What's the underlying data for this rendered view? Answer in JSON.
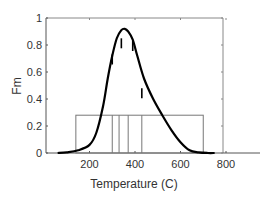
{
  "chart_data": {
    "type": "line",
    "title": "",
    "xlabel": "Temperature (C)",
    "ylabel": "Fm",
    "xlim": [
      0,
      940
    ],
    "ylim": [
      0,
      1
    ],
    "xticks": [
      200,
      400,
      600,
      800
    ],
    "yticks": [
      0,
      0.2,
      0.4,
      0.6,
      0.8,
      1
    ],
    "ytick_labels": [
      "0",
      "0.2",
      "0.4",
      "0.6",
      "0.8",
      "1"
    ],
    "xtick_labels": [
      "200",
      "400",
      "600",
      "800"
    ],
    "grid": false,
    "legend": null,
    "series": [
      {
        "name": "Fm curve",
        "x": [
          60,
          100,
          150,
          200,
          230,
          260,
          280,
          300,
          320,
          340,
          355,
          370,
          390,
          410,
          440,
          480,
          520,
          560,
          600,
          640,
          680,
          720,
          750
        ],
        "y": [
          0.0,
          0.005,
          0.02,
          0.06,
          0.15,
          0.35,
          0.55,
          0.72,
          0.85,
          0.91,
          0.92,
          0.9,
          0.84,
          0.72,
          0.55,
          0.4,
          0.28,
          0.17,
          0.08,
          0.02,
          0.005,
          0.0,
          0.0
        ]
      }
    ],
    "annotations": {
      "outer_box": {
        "x_start": 140,
        "x_end": 700,
        "height": 0.28
      },
      "inner_dividers_x": [
        300,
        330,
        370,
        430
      ],
      "curve_tick_marks": [
        {
          "x": 300,
          "y": 0.7
        },
        {
          "x": 340,
          "y": 0.82
        },
        {
          "x": 390,
          "y": 0.8
        },
        {
          "x": 430,
          "y": 0.45
        }
      ]
    }
  }
}
